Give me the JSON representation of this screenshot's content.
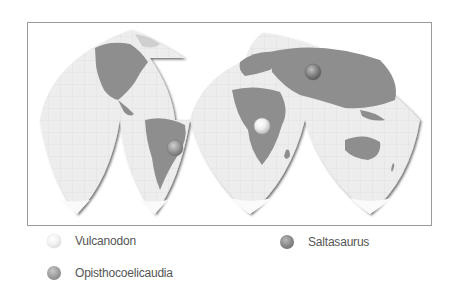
{
  "map": {
    "projection": "interrupted-goode-homolosine",
    "colors": {
      "land": "#8e8e8e",
      "ocean": "#ececec",
      "grid": "#d4d4d4",
      "frame": "#9a9a9a"
    },
    "markers": [
      {
        "name": "Saltasaurus",
        "x": 313,
        "y": 72,
        "style": "dark"
      },
      {
        "name": "Vulcanodon",
        "x": 262,
        "y": 126,
        "style": "light"
      },
      {
        "name": "Opisthocoelicaudia",
        "x": 175,
        "y": 148,
        "style": "mid"
      }
    ]
  },
  "legend": {
    "items": [
      {
        "label": "Vulcanodon",
        "icon": "light-sphere-icon"
      },
      {
        "label": "Saltasaurus",
        "icon": "dark-sphere-icon"
      },
      {
        "label": "Opisthocoelicaudia",
        "icon": "mid-sphere-icon"
      }
    ]
  }
}
